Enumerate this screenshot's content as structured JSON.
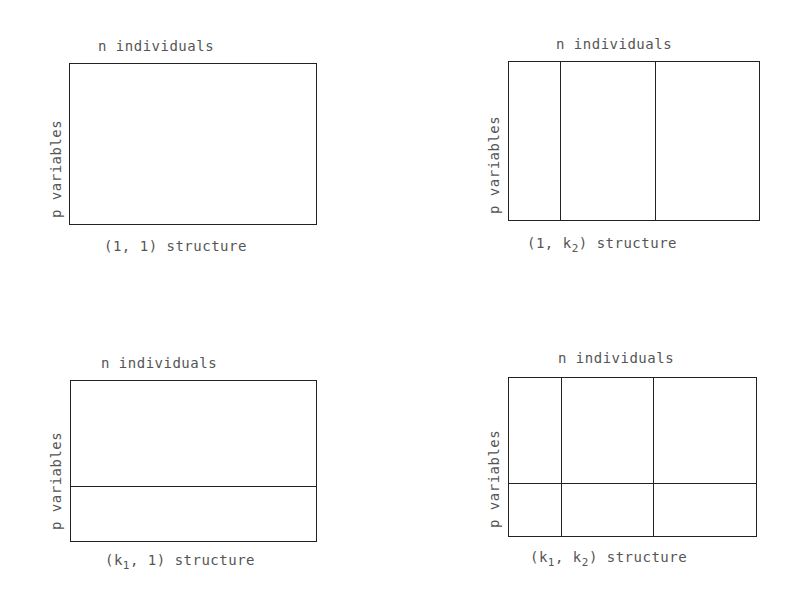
{
  "panels": [
    {
      "top_label": "n individuals",
      "side_label": "p variables",
      "caption_pre": "(1, 1) structure",
      "caption_sub1": "",
      "caption_sub2": ""
    },
    {
      "top_label": "n individuals",
      "side_label": "p variables",
      "caption_a": "(1, k",
      "caption_sub": "2",
      "caption_b": ") structure"
    },
    {
      "top_label": "n individuals",
      "side_label": "p variables",
      "caption_a": "(k",
      "caption_sub": "1",
      "caption_b": ", 1) structure"
    },
    {
      "top_label": "n individuals",
      "side_label": "p variables",
      "caption_a": "(k",
      "caption_sub1": "1",
      "caption_mid": ", k",
      "caption_sub2": "2",
      "caption_b": ") structure"
    }
  ]
}
